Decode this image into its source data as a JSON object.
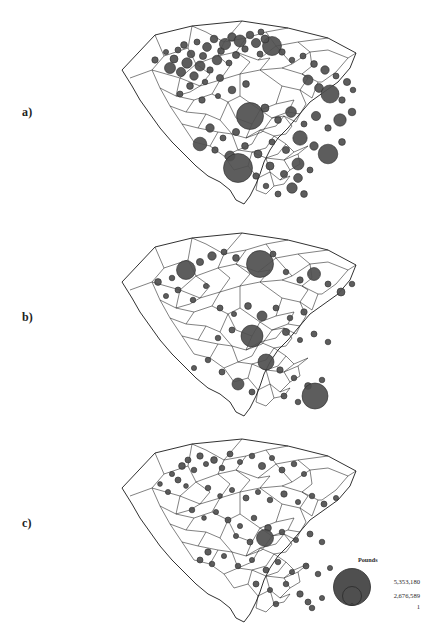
{
  "figure": {
    "background_color": "#ffffff",
    "region_name": "South Carolina",
    "symbol_fill": "#4f4f4f",
    "symbol_stroke": "#2b2b2b",
    "boundary_stroke": "#1a1a1a"
  },
  "panels": [
    {
      "label": "a)",
      "name": "panel-a"
    },
    {
      "label": "b)",
      "name": "panel-b"
    },
    {
      "label": "c)",
      "name": "panel-c"
    }
  ],
  "legend": {
    "title": "Pounds",
    "values": [
      "5,353,180",
      "2,676,589",
      "1"
    ]
  },
  "chart_data": {
    "type": "scatter",
    "title": "Pounds",
    "xlabel": "",
    "ylabel": "",
    "legend_position": "bottom-right",
    "grid": false,
    "value_unit": "Pounds",
    "scale_breaks": [
      5353180,
      2676589,
      1
    ],
    "panels": [
      {
        "label": "a)",
        "points": [
          {
            "x": 95,
            "y": 52,
            "r": 3.2
          },
          {
            "x": 106,
            "y": 44,
            "r": 2.6
          },
          {
            "x": 110,
            "y": 60,
            "r": 5.5
          },
          {
            "x": 114,
            "y": 51,
            "r": 4.0
          },
          {
            "x": 118,
            "y": 42,
            "r": 3.0
          },
          {
            "x": 121,
            "y": 64,
            "r": 4.6
          },
          {
            "x": 124,
            "y": 37,
            "r": 3.4
          },
          {
            "x": 127,
            "y": 55,
            "r": 5.2
          },
          {
            "x": 131,
            "y": 46,
            "r": 3.8
          },
          {
            "x": 134,
            "y": 68,
            "r": 4.2
          },
          {
            "x": 137,
            "y": 34,
            "r": 3.0
          },
          {
            "x": 140,
            "y": 58,
            "r": 5.0
          },
          {
            "x": 143,
            "y": 48,
            "r": 3.6
          },
          {
            "x": 147,
            "y": 39,
            "r": 4.4
          },
          {
            "x": 150,
            "y": 62,
            "r": 3.2
          },
          {
            "x": 154,
            "y": 31,
            "r": 3.8
          },
          {
            "x": 157,
            "y": 52,
            "r": 4.8
          },
          {
            "x": 161,
            "y": 43,
            "r": 3.4
          },
          {
            "x": 165,
            "y": 36,
            "r": 5.6
          },
          {
            "x": 169,
            "y": 55,
            "r": 3.0
          },
          {
            "x": 172,
            "y": 29,
            "r": 4.2
          },
          {
            "x": 176,
            "y": 47,
            "r": 3.6
          },
          {
            "x": 180,
            "y": 33,
            "r": 6.0
          },
          {
            "x": 185,
            "y": 41,
            "r": 3.2
          },
          {
            "x": 190,
            "y": 27,
            "r": 3.8
          },
          {
            "x": 196,
            "y": 35,
            "r": 4.6
          },
          {
            "x": 201,
            "y": 24,
            "r": 3.0
          },
          {
            "x": 130,
            "y": 78,
            "r": 3.4
          },
          {
            "x": 145,
            "y": 74,
            "r": 2.8
          },
          {
            "x": 160,
            "y": 70,
            "r": 3.6
          },
          {
            "x": 120,
            "y": 86,
            "r": 3.0
          },
          {
            "x": 142,
            "y": 92,
            "r": 3.2
          },
          {
            "x": 158,
            "y": 88,
            "r": 2.6
          },
          {
            "x": 172,
            "y": 82,
            "r": 3.8
          },
          {
            "x": 186,
            "y": 76,
            "r": 3.4
          },
          {
            "x": 200,
            "y": 46,
            "r": 3.0
          },
          {
            "x": 212,
            "y": 38,
            "r": 9.5
          },
          {
            "x": 205,
            "y": 31,
            "r": 4.0
          },
          {
            "x": 222,
            "y": 44,
            "r": 3.2
          },
          {
            "x": 232,
            "y": 52,
            "r": 2.8
          },
          {
            "x": 243,
            "y": 48,
            "r": 3.0
          },
          {
            "x": 254,
            "y": 56,
            "r": 3.4
          },
          {
            "x": 265,
            "y": 62,
            "r": 4.2
          },
          {
            "x": 276,
            "y": 68,
            "r": 3.0
          },
          {
            "x": 287,
            "y": 74,
            "r": 3.6
          },
          {
            "x": 248,
            "y": 72,
            "r": 5.0
          },
          {
            "x": 259,
            "y": 80,
            "r": 4.4
          },
          {
            "x": 270,
            "y": 86,
            "r": 9.0
          },
          {
            "x": 282,
            "y": 92,
            "r": 3.2
          },
          {
            "x": 293,
            "y": 82,
            "r": 2.8
          },
          {
            "x": 190,
            "y": 108,
            "r": 13.5
          },
          {
            "x": 205,
            "y": 100,
            "r": 4.0
          },
          {
            "x": 218,
            "y": 112,
            "r": 3.4
          },
          {
            "x": 231,
            "y": 104,
            "r": 5.4
          },
          {
            "x": 244,
            "y": 116,
            "r": 3.0
          },
          {
            "x": 256,
            "y": 108,
            "r": 4.6
          },
          {
            "x": 268,
            "y": 120,
            "r": 3.2
          },
          {
            "x": 280,
            "y": 112,
            "r": 6.2
          },
          {
            "x": 292,
            "y": 104,
            "r": 3.8
          },
          {
            "x": 150,
            "y": 120,
            "r": 4.2
          },
          {
            "x": 163,
            "y": 130,
            "r": 3.0
          },
          {
            "x": 176,
            "y": 124,
            "r": 3.6
          },
          {
            "x": 140,
            "y": 136,
            "r": 6.8
          },
          {
            "x": 155,
            "y": 142,
            "r": 3.2
          },
          {
            "x": 170,
            "y": 148,
            "r": 5.0
          },
          {
            "x": 185,
            "y": 138,
            "r": 3.4
          },
          {
            "x": 198,
            "y": 146,
            "r": 4.0
          },
          {
            "x": 212,
            "y": 134,
            "r": 3.0
          },
          {
            "x": 226,
            "y": 142,
            "r": 3.6
          },
          {
            "x": 240,
            "y": 130,
            "r": 7.2
          },
          {
            "x": 254,
            "y": 138,
            "r": 4.2
          },
          {
            "x": 268,
            "y": 146,
            "r": 9.8
          },
          {
            "x": 282,
            "y": 134,
            "r": 3.4
          },
          {
            "x": 178,
            "y": 160,
            "r": 14.5
          },
          {
            "x": 196,
            "y": 168,
            "r": 3.2
          },
          {
            "x": 210,
            "y": 158,
            "r": 4.0
          },
          {
            "x": 224,
            "y": 166,
            "r": 3.6
          },
          {
            "x": 238,
            "y": 156,
            "r": 6.0
          },
          {
            "x": 238,
            "y": 170,
            "r": 4.4
          },
          {
            "x": 250,
            "y": 162,
            "r": 3.0
          },
          {
            "x": 232,
            "y": 180,
            "r": 5.2
          },
          {
            "x": 244,
            "y": 186,
            "r": 3.4
          },
          {
            "x": 218,
            "y": 186,
            "r": 3.0
          },
          {
            "x": 206,
            "y": 178,
            "r": 2.8
          }
        ]
      },
      {
        "label": "b)",
        "points": [
          {
            "x": 98,
            "y": 62,
            "r": 3.4
          },
          {
            "x": 112,
            "y": 58,
            "r": 2.8
          },
          {
            "x": 126,
            "y": 50,
            "r": 9.5
          },
          {
            "x": 140,
            "y": 42,
            "r": 3.6
          },
          {
            "x": 152,
            "y": 36,
            "r": 4.2
          },
          {
            "x": 164,
            "y": 32,
            "r": 3.0
          },
          {
            "x": 176,
            "y": 38,
            "r": 3.4
          },
          {
            "x": 118,
            "y": 70,
            "r": 3.0
          },
          {
            "x": 106,
            "y": 76,
            "r": 2.6
          },
          {
            "x": 133,
            "y": 80,
            "r": 2.8
          },
          {
            "x": 146,
            "y": 66,
            "r": 2.6
          },
          {
            "x": 200,
            "y": 44,
            "r": 13.5
          },
          {
            "x": 213,
            "y": 34,
            "r": 3.0
          },
          {
            "x": 226,
            "y": 52,
            "r": 2.8
          },
          {
            "x": 240,
            "y": 60,
            "r": 3.2
          },
          {
            "x": 254,
            "y": 54,
            "r": 6.5
          },
          {
            "x": 268,
            "y": 64,
            "r": 3.0
          },
          {
            "x": 281,
            "y": 72,
            "r": 4.0
          },
          {
            "x": 292,
            "y": 64,
            "r": 2.8
          },
          {
            "x": 160,
            "y": 88,
            "r": 3.0
          },
          {
            "x": 174,
            "y": 94,
            "r": 2.6
          },
          {
            "x": 188,
            "y": 86,
            "r": 3.4
          },
          {
            "x": 202,
            "y": 96,
            "r": 5.0
          },
          {
            "x": 216,
            "y": 88,
            "r": 3.0
          },
          {
            "x": 230,
            "y": 98,
            "r": 2.8
          },
          {
            "x": 244,
            "y": 92,
            "r": 3.2
          },
          {
            "x": 192,
            "y": 116,
            "r": 11.0
          },
          {
            "x": 172,
            "y": 110,
            "r": 3.0
          },
          {
            "x": 158,
            "y": 118,
            "r": 2.8
          },
          {
            "x": 226,
            "y": 112,
            "r": 3.6
          },
          {
            "x": 240,
            "y": 120,
            "r": 2.6
          },
          {
            "x": 254,
            "y": 114,
            "r": 3.0
          },
          {
            "x": 268,
            "y": 122,
            "r": 2.8
          },
          {
            "x": 206,
            "y": 142,
            "r": 8.0
          },
          {
            "x": 148,
            "y": 140,
            "r": 2.8
          },
          {
            "x": 134,
            "y": 148,
            "r": 2.6
          },
          {
            "x": 162,
            "y": 152,
            "r": 3.0
          },
          {
            "x": 220,
            "y": 150,
            "r": 3.2
          },
          {
            "x": 234,
            "y": 158,
            "r": 2.8
          },
          {
            "x": 178,
            "y": 164,
            "r": 6.0
          },
          {
            "x": 192,
            "y": 172,
            "r": 3.0
          },
          {
            "x": 248,
            "y": 166,
            "r": 3.4
          },
          {
            "x": 262,
            "y": 160,
            "r": 2.8
          },
          {
            "x": 255,
            "y": 176,
            "r": 13.0
          },
          {
            "x": 238,
            "y": 182,
            "r": 2.8
          },
          {
            "x": 224,
            "y": 176,
            "r": 3.0
          }
        ]
      },
      {
        "label": "c)",
        "points": [
          {
            "x": 100,
            "y": 58,
            "r": 2.4
          },
          {
            "x": 112,
            "y": 48,
            "r": 2.6
          },
          {
            "x": 122,
            "y": 40,
            "r": 3.4
          },
          {
            "x": 128,
            "y": 34,
            "r": 3.0
          },
          {
            "x": 134,
            "y": 44,
            "r": 2.8
          },
          {
            "x": 140,
            "y": 30,
            "r": 3.2
          },
          {
            "x": 146,
            "y": 38,
            "r": 2.6
          },
          {
            "x": 118,
            "y": 54,
            "r": 3.0
          },
          {
            "x": 126,
            "y": 60,
            "r": 2.4
          },
          {
            "x": 108,
            "y": 66,
            "r": 2.6
          },
          {
            "x": 154,
            "y": 34,
            "r": 3.4
          },
          {
            "x": 162,
            "y": 42,
            "r": 2.8
          },
          {
            "x": 170,
            "y": 28,
            "r": 3.0
          },
          {
            "x": 180,
            "y": 36,
            "r": 2.6
          },
          {
            "x": 192,
            "y": 30,
            "r": 2.8
          },
          {
            "x": 202,
            "y": 40,
            "r": 3.6
          },
          {
            "x": 212,
            "y": 32,
            "r": 2.6
          },
          {
            "x": 222,
            "y": 44,
            "r": 3.0
          },
          {
            "x": 234,
            "y": 38,
            "r": 2.8
          },
          {
            "x": 244,
            "y": 48,
            "r": 2.6
          },
          {
            "x": 148,
            "y": 62,
            "r": 2.8
          },
          {
            "x": 160,
            "y": 70,
            "r": 2.4
          },
          {
            "x": 172,
            "y": 64,
            "r": 2.6
          },
          {
            "x": 186,
            "y": 72,
            "r": 3.0
          },
          {
            "x": 198,
            "y": 66,
            "r": 2.6
          },
          {
            "x": 210,
            "y": 74,
            "r": 2.8
          },
          {
            "x": 224,
            "y": 68,
            "r": 3.2
          },
          {
            "x": 238,
            "y": 76,
            "r": 2.6
          },
          {
            "x": 252,
            "y": 70,
            "r": 2.8
          },
          {
            "x": 264,
            "y": 78,
            "r": 3.0
          },
          {
            "x": 276,
            "y": 72,
            "r": 2.6
          },
          {
            "x": 132,
            "y": 84,
            "r": 2.8
          },
          {
            "x": 144,
            "y": 92,
            "r": 2.4
          },
          {
            "x": 156,
            "y": 86,
            "r": 2.6
          },
          {
            "x": 168,
            "y": 94,
            "r": 3.0
          },
          {
            "x": 180,
            "y": 100,
            "r": 2.6
          },
          {
            "x": 194,
            "y": 92,
            "r": 2.8
          },
          {
            "x": 208,
            "y": 102,
            "r": 3.4
          },
          {
            "x": 205,
            "y": 112,
            "r": 8.5
          },
          {
            "x": 190,
            "y": 116,
            "r": 3.0
          },
          {
            "x": 176,
            "y": 110,
            "r": 2.6
          },
          {
            "x": 222,
            "y": 106,
            "r": 2.8
          },
          {
            "x": 236,
            "y": 114,
            "r": 2.6
          },
          {
            "x": 250,
            "y": 108,
            "r": 3.0
          },
          {
            "x": 262,
            "y": 116,
            "r": 2.8
          },
          {
            "x": 148,
            "y": 126,
            "r": 3.2
          },
          {
            "x": 140,
            "y": 134,
            "r": 3.0
          },
          {
            "x": 152,
            "y": 138,
            "r": 2.8
          },
          {
            "x": 164,
            "y": 130,
            "r": 2.6
          },
          {
            "x": 178,
            "y": 140,
            "r": 2.8
          },
          {
            "x": 192,
            "y": 134,
            "r": 2.6
          },
          {
            "x": 206,
            "y": 144,
            "r": 3.0
          },
          {
            "x": 218,
            "y": 136,
            "r": 2.8
          },
          {
            "x": 232,
            "y": 146,
            "r": 2.6
          },
          {
            "x": 246,
            "y": 140,
            "r": 3.0
          },
          {
            "x": 258,
            "y": 148,
            "r": 2.8
          },
          {
            "x": 270,
            "y": 142,
            "r": 2.6
          },
          {
            "x": 196,
            "y": 158,
            "r": 3.0
          },
          {
            "x": 210,
            "y": 164,
            "r": 2.6
          },
          {
            "x": 226,
            "y": 158,
            "r": 2.8
          },
          {
            "x": 240,
            "y": 168,
            "r": 3.2
          },
          {
            "x": 248,
            "y": 176,
            "r": 3.0
          },
          {
            "x": 252,
            "y": 182,
            "r": 2.8
          },
          {
            "x": 262,
            "y": 172,
            "r": 2.6
          },
          {
            "x": 216,
            "y": 178,
            "r": 2.8
          }
        ]
      }
    ]
  }
}
